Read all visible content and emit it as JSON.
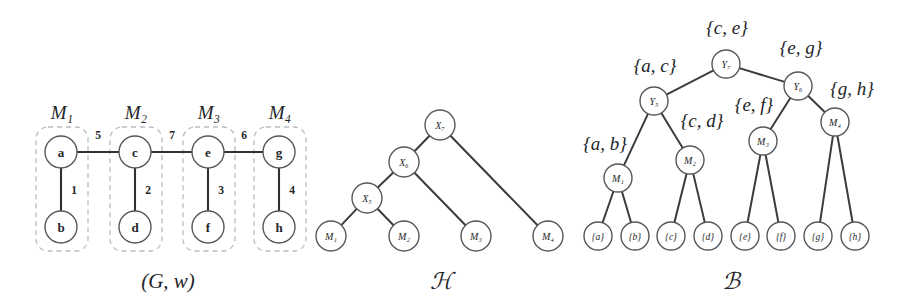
{
  "figure": {
    "background": "#ffffff",
    "ink": "#232528",
    "dash_color": "#b9bcc0",
    "panels": [
      {
        "id": "Gw",
        "caption": "(G, w)",
        "caption_x": 168,
        "caption_y": 281
      },
      {
        "id": "H",
        "caption": "ℋ",
        "caption_x": 441,
        "caption_y": 281
      },
      {
        "id": "B",
        "caption": "ℬ",
        "caption_x": 731,
        "caption_y": 281
      }
    ]
  },
  "graph_Gw": {
    "caption": "(G, w)",
    "groups": [
      {
        "label": "M₁",
        "label_x": 62,
        "label_y": 112,
        "x": 36,
        "y": 127,
        "w": 52,
        "h": 124
      },
      {
        "label": "M₂",
        "label_x": 136,
        "label_y": 112,
        "x": 110,
        "y": 127,
        "w": 52,
        "h": 124
      },
      {
        "label": "M₃",
        "label_x": 209,
        "label_y": 112,
        "x": 183,
        "y": 127,
        "w": 52,
        "h": 124
      },
      {
        "label": "M₄",
        "label_x": 280,
        "label_y": 112,
        "x": 254,
        "y": 127,
        "w": 52,
        "h": 124
      }
    ],
    "vertices": [
      {
        "id": "a",
        "label": "a",
        "x": 61,
        "y": 152,
        "r": 16
      },
      {
        "id": "b",
        "label": "b",
        "x": 61,
        "y": 227,
        "r": 16
      },
      {
        "id": "c",
        "label": "c",
        "x": 135,
        "y": 152,
        "r": 16
      },
      {
        "id": "d",
        "label": "d",
        "x": 135,
        "y": 227,
        "r": 16
      },
      {
        "id": "e",
        "label": "e",
        "x": 208,
        "y": 152,
        "r": 16
      },
      {
        "id": "f",
        "label": "f",
        "x": 208,
        "y": 227,
        "r": 16
      },
      {
        "id": "g",
        "label": "g",
        "x": 279,
        "y": 152,
        "r": 16
      },
      {
        "id": "h",
        "label": "h",
        "x": 279,
        "y": 227,
        "r": 16
      }
    ],
    "edges": [
      {
        "from": "a",
        "to": "b",
        "weight": "1",
        "wx": 74,
        "wy": 190
      },
      {
        "from": "c",
        "to": "d",
        "weight": "2",
        "wx": 148,
        "wy": 190
      },
      {
        "from": "e",
        "to": "f",
        "weight": "3",
        "wx": 221,
        "wy": 190
      },
      {
        "from": "g",
        "to": "h",
        "weight": "4",
        "wx": 292,
        "wy": 190
      },
      {
        "from": "a",
        "to": "c",
        "weight": "5",
        "wx": 98,
        "wy": 135
      },
      {
        "from": "c",
        "to": "e",
        "weight": "7",
        "wx": 172,
        "wy": 135
      },
      {
        "from": "e",
        "to": "g",
        "weight": "6",
        "wx": 244,
        "wy": 135
      }
    ]
  },
  "tree_H": {
    "caption": "ℋ",
    "nodes": [
      {
        "id": "X7",
        "label": "X₇",
        "x": 440,
        "y": 125,
        "r": 15
      },
      {
        "id": "X6",
        "label": "X₆",
        "x": 404,
        "y": 162,
        "r": 15
      },
      {
        "id": "X5",
        "label": "X₅",
        "x": 367,
        "y": 198,
        "r": 15
      },
      {
        "id": "M1",
        "label": "M₁",
        "x": 331,
        "y": 236,
        "r": 15
      },
      {
        "id": "M2",
        "label": "M₂",
        "x": 404,
        "y": 236,
        "r": 15
      },
      {
        "id": "M3",
        "label": "M₃",
        "x": 476,
        "y": 236,
        "r": 15
      },
      {
        "id": "M4",
        "label": "M₄",
        "x": 548,
        "y": 236,
        "r": 15
      }
    ],
    "edges": [
      {
        "from": "X7",
        "to": "X6"
      },
      {
        "from": "X7",
        "to": "M4"
      },
      {
        "from": "X6",
        "to": "X5"
      },
      {
        "from": "X6",
        "to": "M3"
      },
      {
        "from": "X5",
        "to": "M1"
      },
      {
        "from": "X5",
        "to": "M2"
      }
    ]
  },
  "tree_B": {
    "caption": "ℬ",
    "nodes": [
      {
        "id": "Y7",
        "label": "Y₇",
        "x": 726,
        "y": 64,
        "r": 14
      },
      {
        "id": "Y5",
        "label": "Y₅",
        "x": 654,
        "y": 101,
        "r": 14
      },
      {
        "id": "Y6",
        "label": "Y₆",
        "x": 798,
        "y": 86,
        "r": 14
      },
      {
        "id": "M1",
        "label": "M₁",
        "x": 618,
        "y": 178,
        "r": 14
      },
      {
        "id": "M2",
        "label": "M₂",
        "x": 690,
        "y": 160,
        "r": 14
      },
      {
        "id": "M3",
        "label": "M₃",
        "x": 763,
        "y": 141,
        "r": 14
      },
      {
        "id": "M4",
        "label": "M₄",
        "x": 835,
        "y": 122,
        "r": 14
      },
      {
        "id": "La",
        "label": "{a}",
        "x": 598,
        "y": 236,
        "r": 14
      },
      {
        "id": "Lb",
        "label": "{b}",
        "x": 635,
        "y": 236,
        "r": 14
      },
      {
        "id": "Lc",
        "label": "{c}",
        "x": 671,
        "y": 236,
        "r": 14
      },
      {
        "id": "Ld",
        "label": "{d}",
        "x": 708,
        "y": 236,
        "r": 14
      },
      {
        "id": "Le",
        "label": "{e}",
        "x": 745,
        "y": 236,
        "r": 14
      },
      {
        "id": "Lf",
        "label": "{f}",
        "x": 781,
        "y": 236,
        "r": 14
      },
      {
        "id": "Lg",
        "label": "{g}",
        "x": 818,
        "y": 236,
        "r": 14
      },
      {
        "id": "Lh",
        "label": "{h}",
        "x": 855,
        "y": 236,
        "r": 14
      }
    ],
    "edges": [
      {
        "from": "Y7",
        "to": "Y5"
      },
      {
        "from": "Y7",
        "to": "Y6"
      },
      {
        "from": "Y5",
        "to": "M1"
      },
      {
        "from": "Y5",
        "to": "M2"
      },
      {
        "from": "Y6",
        "to": "M3"
      },
      {
        "from": "Y6",
        "to": "M4"
      },
      {
        "from": "M1",
        "to": "La"
      },
      {
        "from": "M1",
        "to": "Lb"
      },
      {
        "from": "M2",
        "to": "Lc"
      },
      {
        "from": "M2",
        "to": "Ld"
      },
      {
        "from": "M3",
        "to": "Le"
      },
      {
        "from": "M3",
        "to": "Lf"
      },
      {
        "from": "M4",
        "to": "Lg"
      },
      {
        "from": "M4",
        "to": "Lh"
      }
    ],
    "set_labels": [
      {
        "text": "{c, e}",
        "x": 727,
        "y": 27
      },
      {
        "text": "{e, g}",
        "x": 801,
        "y": 47
      },
      {
        "text": "{a, c}",
        "x": 655,
        "y": 65
      },
      {
        "text": "{g, h}",
        "x": 852,
        "y": 88
      },
      {
        "text": "{c, d}",
        "x": 702,
        "y": 120
      },
      {
        "text": "{e, f}",
        "x": 754,
        "y": 104
      },
      {
        "text": "{a, b}",
        "x": 605,
        "y": 143
      }
    ]
  }
}
